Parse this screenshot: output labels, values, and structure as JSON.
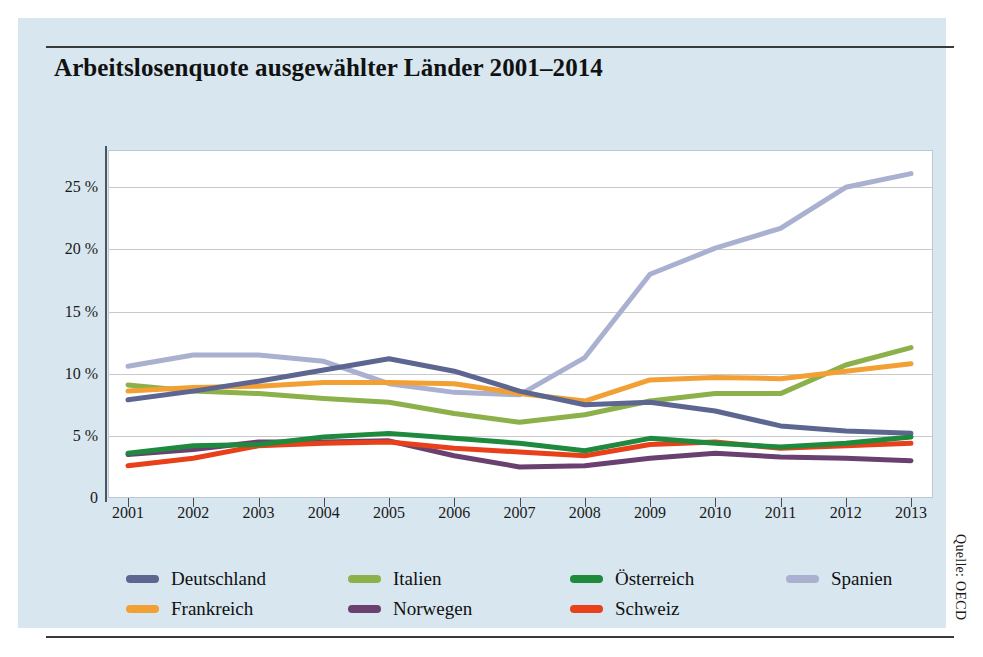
{
  "title": "Arbeitslosenquote ausgewählter Länder 2001–2014",
  "source": "Quelle: OECD",
  "legend": [
    {
      "label": "Deutschland",
      "color": "#5c6691"
    },
    {
      "label": "Italien",
      "color": "#8cb04a"
    },
    {
      "label": "Österreich",
      "color": "#1d8a3e"
    },
    {
      "label": "Spanien",
      "color": "#aab0cf"
    },
    {
      "label": "Frankreich",
      "color": "#f2a033"
    },
    {
      "label": "Norwegen",
      "color": "#6a4070"
    },
    {
      "label": "Schweiz",
      "color": "#e8401a"
    }
  ],
  "chart_data": {
    "type": "line",
    "title": "Arbeitslosenquote ausgewählter Länder 2001–2014",
    "xlabel": "",
    "ylabel": "",
    "x": [
      2001,
      2002,
      2003,
      2004,
      2005,
      2006,
      2007,
      2008,
      2009,
      2010,
      2011,
      2012,
      2013
    ],
    "xtick_labels": [
      "2001",
      "2002",
      "2003",
      "2004",
      "2005",
      "2006",
      "2007",
      "2008",
      "2009",
      "2010",
      "2011",
      "2012",
      "2013"
    ],
    "ytick_values": [
      0,
      5,
      10,
      15,
      20,
      25
    ],
    "ytick_labels": [
      "0",
      "5 %",
      "10 %",
      "15 %",
      "20 %",
      "25 %"
    ],
    "ylim": [
      0,
      28
    ],
    "grid": true,
    "legend_position": "below",
    "series": [
      {
        "name": "Deutschland",
        "color": "#5c6691",
        "values": [
          7.9,
          8.6,
          9.4,
          10.3,
          11.2,
          10.2,
          8.6,
          7.5,
          7.7,
          7.0,
          5.8,
          5.4,
          5.2
        ]
      },
      {
        "name": "Italien",
        "color": "#8cb04a",
        "values": [
          9.1,
          8.6,
          8.4,
          8.0,
          7.7,
          6.8,
          6.1,
          6.7,
          7.8,
          8.4,
          8.4,
          10.7,
          12.1
        ]
      },
      {
        "name": "Österreich",
        "color": "#1d8a3e",
        "values": [
          3.6,
          4.2,
          4.3,
          4.9,
          5.2,
          4.8,
          4.4,
          3.8,
          4.8,
          4.4,
          4.1,
          4.4,
          4.9
        ]
      },
      {
        "name": "Spanien",
        "color": "#aab0cf",
        "values": [
          10.6,
          11.5,
          11.5,
          11.0,
          9.2,
          8.5,
          8.3,
          11.3,
          18.0,
          20.1,
          21.7,
          25.0,
          26.1
        ]
      },
      {
        "name": "Frankreich",
        "color": "#f2a033",
        "values": [
          8.6,
          8.9,
          9.0,
          9.3,
          9.3,
          9.2,
          8.4,
          7.8,
          9.5,
          9.7,
          9.6,
          10.2,
          10.8
        ]
      },
      {
        "name": "Norwegen",
        "color": "#6a4070",
        "values": [
          3.5,
          3.9,
          4.5,
          4.5,
          4.6,
          3.4,
          2.5,
          2.6,
          3.2,
          3.6,
          3.3,
          3.2,
          3.0
        ]
      },
      {
        "name": "Schweiz",
        "color": "#e8401a",
        "values": [
          2.6,
          3.2,
          4.2,
          4.4,
          4.5,
          4.0,
          3.7,
          3.4,
          4.3,
          4.5,
          4.0,
          4.2,
          4.4
        ]
      }
    ]
  }
}
